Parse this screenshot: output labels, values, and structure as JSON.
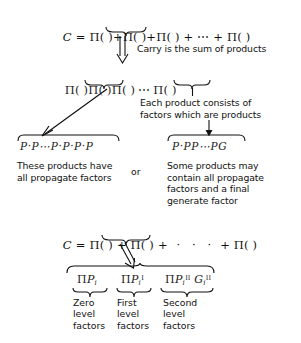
{
  "figure": {
    "type": "carry-decomposition-diagram",
    "background": "#ffffff",
    "ink": "#111111"
  },
  "equations": {
    "top": {
      "lhs": "C",
      "equals": "=",
      "terms": [
        "Π( )",
        "Π( )",
        "Π( )",
        "Π( )"
      ],
      "ellipsis": "⋯",
      "full": "C = Π( )+Π( )+Π( ) + ⋯ +Π( )"
    },
    "expansion_row": {
      "full": "Π( )Π( )Π( ) ⋯ Π( )",
      "terms": [
        "Π( )",
        "Π( )",
        "Π( )",
        "Π( )"
      ],
      "ellipsis": "⋯"
    },
    "second": {
      "lhs": "C",
      "equals": "=",
      "terms": [
        "Π( )",
        "Π( )",
        "Π( )"
      ],
      "ellipsis": "·   ·   ·",
      "full": "C = Π( ) + Π( ) +   ·   ·   ·   + Π( )"
    }
  },
  "products": {
    "left": {
      "expression": "P·P⋯P·P·P·P",
      "caption": "These products have\nall propagate factors"
    },
    "separator": "or",
    "right": {
      "expression": "P·PP⋯PG",
      "caption": "Some products may\ncontain all propagate\nfactors and a final\ngenerate factor"
    }
  },
  "annotations": {
    "carry": "Carry is the sum of products",
    "each_product": "Each product consists of\nfactors which are products"
  },
  "levels": [
    {
      "term_pi": "Π",
      "term_base": "P",
      "term_sub": "i",
      "term_sup": "",
      "extra_base": "",
      "extra_sub": "",
      "extra_sup": "",
      "label": "Zero\nlevel\nfactors"
    },
    {
      "term_pi": "Π",
      "term_base": "P",
      "term_sub": "i",
      "term_sup": "I",
      "extra_base": "",
      "extra_sub": "",
      "extra_sup": "",
      "label": "First\nlevel\nfactors"
    },
    {
      "term_pi": "Π",
      "term_base": "P",
      "term_sub": "i",
      "term_sup": "II",
      "extra_base": "G",
      "extra_sub": "i",
      "extra_sup": "II",
      "label": "Second\nlevel\nfactors"
    }
  ]
}
